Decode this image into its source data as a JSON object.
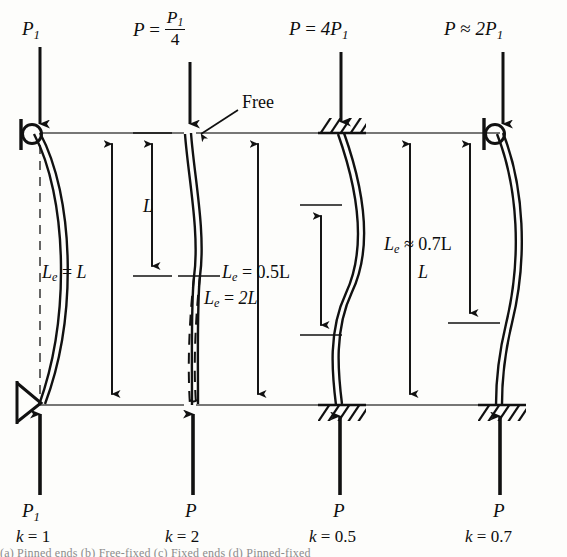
{
  "figure": {
    "type": "engineering-diagram",
    "reference_lines": {
      "top_y": 133,
      "bottom_y": 405
    },
    "caption_faint": "(a) Pinned ends  (b) Free-fixed  (c) Fixed ends  (d) Pinned-fixed"
  },
  "columns": [
    {
      "id": "a",
      "center_x": 40,
      "top_label": {
        "P": "P",
        "sub": "1",
        "full": "P1"
      },
      "bottom_load_label": {
        "P": "P",
        "sub": "1",
        "full": "P1"
      },
      "k_label": {
        "k": "k",
        "eq": "=",
        "value": "1"
      },
      "effective_length_label": {
        "Le": "L",
        "sub": "e",
        "eq": "=",
        "value": "L"
      },
      "top_support": "pin-circle",
      "bottom_support": "knife-edge-pin",
      "shape": "single-half-sine-bow",
      "has_dashed_centerline": true,
      "has_dashed_extension": false,
      "dimension_arrows": [
        {
          "name": "Le",
          "y_top": 133,
          "y_bottom": 405,
          "x": 112
        }
      ]
    },
    {
      "id": "b",
      "center_x": 184,
      "top_label": {
        "P": "P",
        "eq": "=",
        "numerator": "P",
        "numerator_sub": "1",
        "denominator": "4",
        "full": "P = P1/4"
      },
      "bottom_load_label": {
        "P": "P",
        "full": "P"
      },
      "k_label": {
        "k": "k",
        "eq": "=",
        "value": "2"
      },
      "effective_length_label": {
        "Le": "L",
        "sub": "e",
        "eq": "=",
        "value": "2L"
      },
      "length_label": {
        "L": "L"
      },
      "free_end_label": "Free",
      "top_support": "free",
      "bottom_support": "fixed-implied",
      "shape": "quarter-sine-cantilever",
      "has_dashed_centerline": false,
      "has_dashed_extension": true,
      "dimension_arrows": [
        {
          "name": "L",
          "y_top": 133,
          "y_bottom": 276,
          "x": 152
        },
        {
          "name": "Le",
          "y_top": 133,
          "y_bottom": 405,
          "x": 258
        }
      ]
    },
    {
      "id": "c",
      "center_x": 340,
      "top_label": {
        "P": "P",
        "eq": "=",
        "value": "4P",
        "sub": "1",
        "full": "P = 4P1"
      },
      "bottom_load_label": {
        "P": "P",
        "full": "P"
      },
      "k_label": {
        "k": "k",
        "eq": "=",
        "value": "0.5"
      },
      "effective_length_label": {
        "Le": "L",
        "sub": "e",
        "eq": "=",
        "value": "0.5L"
      },
      "length_label": {
        "L": "L"
      },
      "top_support": "fixed-hatched",
      "bottom_support": "fixed-hatched",
      "shape": "full-sine-double-curvature",
      "has_dashed_centerline": false,
      "has_dashed_extension": false,
      "dimension_arrows": [
        {
          "name": "Le",
          "y_top": 205,
          "y_bottom": 335,
          "x": 321
        },
        {
          "name": "L",
          "y_top": 133,
          "y_bottom": 405,
          "x": 410
        }
      ]
    },
    {
      "id": "d",
      "center_x": 500,
      "top_label": {
        "P": "P",
        "approx": "≈",
        "value": "2P",
        "sub": "1",
        "full": "P ≈ 2P1"
      },
      "bottom_load_label": {
        "P": "P",
        "full": "P"
      },
      "k_label": {
        "k": "k",
        "eq": "=",
        "value": "0.7"
      },
      "effective_length_label": {
        "Le": "L",
        "sub": "e",
        "approx": "≈",
        "value": "0.7L"
      },
      "top_support": "pin-circle",
      "bottom_support": "fixed-hatched",
      "shape": "pinned-fixed-curve",
      "has_dashed_centerline": false,
      "has_dashed_extension": false,
      "dimension_arrows": [
        {
          "name": "Le",
          "y_top": 133,
          "y_bottom": 323,
          "x": 470
        }
      ]
    }
  ],
  "colors": {
    "ink": "#111111",
    "paper": "#fdfdfb",
    "reference_line": "#4a4a4a",
    "faint_caption": "#8c8c8c"
  }
}
